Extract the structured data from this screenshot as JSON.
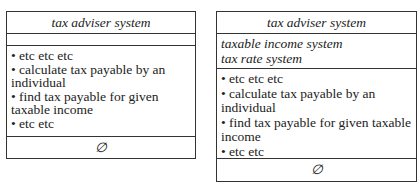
{
  "diagrams": [
    {
      "class_name": "tax adviser system",
      "attributes": [],
      "operations": [
        "• etc etc etc",
        "• calculate tax payable by an individual",
        "• find tax payable for given taxable income",
        "• etc etc"
      ],
      "footer": "∅"
    },
    {
      "class_name": "tax adviser system",
      "attributes": [
        "taxable income system",
        "tax rate system"
      ],
      "operations": [
        "• etc etc etc",
        "• calculate tax payable by an individual",
        "• find tax payable for given taxable income",
        "• etc etc"
      ],
      "footer": "∅"
    }
  ]
}
